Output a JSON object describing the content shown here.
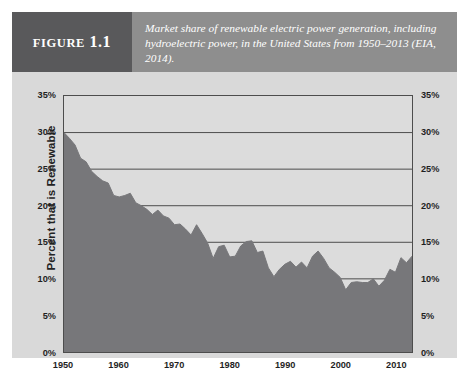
{
  "figure": {
    "label_word": "Figure",
    "label_number": "1.1",
    "caption": "Market share of renewable electric power generation, including hydroelectric power, in the United States from 1950–2013 (EIA, 2014)."
  },
  "colors": {
    "label_block": "#59595b",
    "caption_band": "#8e8e8e",
    "panel_background": "#d9d9d9",
    "plot_background": "#dcdcdc",
    "area_fill": "#77777a",
    "axis_line": "#4d4d4d",
    "text": "#1f1f1f"
  },
  "chart_data": {
    "type": "area",
    "title": "Market share of renewable electric power generation, including hydroelectric power, in the United States from 1950–2013 (EIA, 2014).",
    "xlabel": "",
    "ylabel": "Percent that is Renewable",
    "xlim": [
      1950,
      2013
    ],
    "ylim": [
      0,
      35
    ],
    "grid": true,
    "legend": "none",
    "y_tick_labels_left": [
      "35%",
      "30%",
      "25%",
      "20%",
      "15%",
      "10%",
      "5%",
      "0%"
    ],
    "y_tick_labels_right": [
      "35%",
      "30%",
      "25%",
      "20%",
      "15%",
      "10%",
      "5%",
      "0%"
    ],
    "y_tick_values": [
      35,
      30,
      25,
      20,
      15,
      10,
      5,
      0
    ],
    "x_tick_labels": [
      "1950",
      "1960",
      "1970",
      "1980",
      "1990",
      "2000",
      "2010"
    ],
    "x_tick_values": [
      1950,
      1960,
      1970,
      1980,
      1990,
      2000,
      2010
    ],
    "series": [
      {
        "name": "Percent that is Renewable",
        "x": [
          1950,
          1951,
          1952,
          1953,
          1954,
          1955,
          1956,
          1957,
          1958,
          1959,
          1960,
          1961,
          1962,
          1963,
          1964,
          1965,
          1966,
          1967,
          1968,
          1969,
          1970,
          1971,
          1972,
          1973,
          1974,
          1975,
          1976,
          1977,
          1978,
          1979,
          1980,
          1981,
          1982,
          1983,
          1984,
          1985,
          1986,
          1987,
          1988,
          1989,
          1990,
          1991,
          1992,
          1993,
          1994,
          1995,
          1996,
          1997,
          1998,
          1999,
          2000,
          2001,
          2002,
          2003,
          2004,
          2005,
          2006,
          2007,
          2008,
          2009,
          2010,
          2011,
          2012,
          2013
        ],
        "values": [
          30.0,
          29.2,
          28.3,
          26.5,
          26.0,
          24.7,
          24.0,
          23.4,
          23.1,
          21.4,
          21.2,
          21.4,
          21.7,
          20.4,
          20.0,
          19.5,
          18.8,
          19.4,
          18.6,
          18.3,
          17.4,
          17.5,
          16.8,
          16.0,
          17.4,
          16.2,
          14.9,
          12.8,
          14.4,
          14.6,
          13.0,
          13.1,
          14.5,
          15.1,
          15.2,
          13.6,
          13.8,
          11.5,
          10.3,
          11.3,
          12.0,
          12.4,
          11.6,
          12.3,
          11.5,
          13.1,
          13.8,
          12.8,
          11.5,
          10.9,
          10.2,
          8.5,
          9.5,
          9.6,
          9.5,
          9.5,
          10.0,
          9.0,
          9.8,
          11.3,
          10.9,
          12.9,
          12.2,
          13.1
        ]
      }
    ]
  }
}
